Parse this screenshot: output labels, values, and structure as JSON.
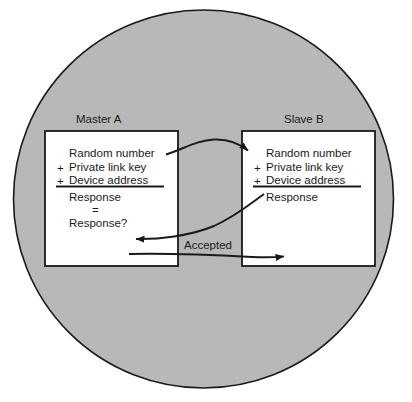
{
  "diagram": {
    "background_color": "#ffffff",
    "circle_fill": "#b8b8b8",
    "circle_stroke": "#1a1a1a",
    "box_fill": "#ffffff",
    "box_stroke": "#1a1a1a",
    "text_color": "#1a1a1a"
  },
  "master": {
    "label": "Master A",
    "rows": [
      {
        "op": "",
        "text": "Random number"
      },
      {
        "op": "+",
        "text": "Private link key"
      },
      {
        "op": "+",
        "text": "Device address"
      }
    ],
    "result_lines": [
      "Response",
      "=",
      "Response?"
    ]
  },
  "slave": {
    "label": "Slave B",
    "rows": [
      {
        "op": "",
        "text": "Random number"
      },
      {
        "op": "+",
        "text": "Private link key"
      },
      {
        "op": "+",
        "text": "Device address"
      }
    ],
    "result_lines": [
      "Response"
    ]
  },
  "arrows": [
    {
      "name": "random-number-arrow",
      "label": "",
      "direction": "master-to-slave"
    },
    {
      "name": "response-arrow",
      "label": "",
      "direction": "slave-to-master"
    },
    {
      "name": "accepted-arrow",
      "label": "Accepted",
      "direction": "master-to-slave"
    }
  ]
}
